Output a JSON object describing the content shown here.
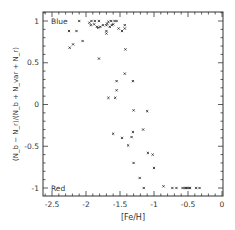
{
  "chart_data": {
    "type": "scatter",
    "title": "",
    "xlabel": "[Fe/H]",
    "ylabel": "(N_b − N_r)/(N_b + N_var + N_r)",
    "xlim": [
      -2.6,
      0
    ],
    "ylim": [
      -1.1,
      1.1
    ],
    "xticks": [
      -2.5,
      -2,
      -1.5,
      -1,
      -0.5,
      0
    ],
    "xtick_labels": [
      "-2.5",
      "-2",
      "-1.5",
      "-1",
      "-0.5",
      "0"
    ],
    "yticks": [
      -1,
      -0.5,
      0,
      0.5,
      1
    ],
    "ytick_labels": [
      "-1",
      "-0.5",
      "0",
      "0.5",
      "1"
    ],
    "grid": false,
    "legend": null,
    "annotations": [
      {
        "text": "Blue",
        "x": -2.5,
        "y": 1
      },
      {
        "text": "Red",
        "x": -2.5,
        "y": -1
      }
    ],
    "series": [
      {
        "name": "clusters",
        "marker": "x",
        "points": [
          [
            -2.1,
            1.0
          ],
          [
            -1.95,
            0.98
          ],
          [
            -1.92,
            1.0
          ],
          [
            -1.87,
            1.0
          ],
          [
            -1.81,
            1.0
          ],
          [
            -1.93,
            0.95
          ],
          [
            -1.88,
            0.96
          ],
          [
            -1.84,
            0.93
          ],
          [
            -1.82,
            0.92
          ],
          [
            -1.79,
            0.93
          ],
          [
            -1.75,
            0.95
          ],
          [
            -1.7,
            0.95
          ],
          [
            -1.69,
            0.97
          ],
          [
            -1.67,
            0.99
          ],
          [
            -1.65,
            0.93
          ],
          [
            -1.63,
            1.0
          ],
          [
            -1.62,
            0.95
          ],
          [
            -1.6,
            0.96
          ],
          [
            -1.58,
            1.0
          ],
          [
            -1.55,
            1.0
          ],
          [
            -1.52,
            0.91
          ],
          [
            -1.47,
            0.88
          ],
          [
            -1.43,
            0.95
          ],
          [
            -1.43,
            0.91
          ],
          [
            -1.7,
            0.88
          ],
          [
            -1.7,
            0.85
          ],
          [
            -2.25,
            0.88
          ],
          [
            -2.14,
            0.88
          ],
          [
            -2.05,
            0.76
          ],
          [
            -2.19,
            0.72
          ],
          [
            -2.24,
            0.68
          ],
          [
            -1.42,
            0.66
          ],
          [
            -1.81,
            0.55
          ],
          [
            -1.43,
            0.37
          ],
          [
            -1.55,
            0.28
          ],
          [
            -1.31,
            0.28
          ],
          [
            -1.55,
            0.17
          ],
          [
            -1.67,
            0.08
          ],
          [
            -1.57,
            0.08
          ],
          [
            -1.3,
            -0.07
          ],
          [
            -1.1,
            -0.08
          ],
          [
            -1.6,
            -0.35
          ],
          [
            -1.31,
            -0.33
          ],
          [
            -1.16,
            -0.3
          ],
          [
            -1.47,
            -0.4
          ],
          [
            -1.33,
            -0.39
          ],
          [
            -1.38,
            -0.49
          ],
          [
            -1.09,
            -0.58
          ],
          [
            -1.02,
            -0.6
          ],
          [
            -1.3,
            -0.7
          ],
          [
            -1.0,
            -0.76
          ],
          [
            -1.21,
            -0.88
          ],
          [
            -1.15,
            -1.0
          ],
          [
            -0.86,
            -0.98
          ],
          [
            -0.73,
            -1.0
          ],
          [
            -0.67,
            -1.0
          ],
          [
            -0.58,
            -1.0
          ],
          [
            -0.55,
            -1.0
          ],
          [
            -0.53,
            -1.0
          ],
          [
            -0.51,
            -1.0
          ],
          [
            -0.49,
            -1.0
          ],
          [
            -0.47,
            -1.0
          ],
          [
            -0.38,
            -1.0
          ],
          [
            -0.33,
            -1.0
          ]
        ]
      }
    ]
  }
}
